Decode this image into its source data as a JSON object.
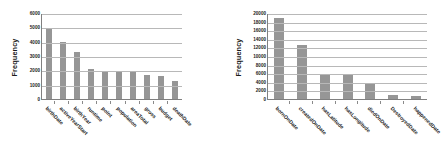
{
  "figure": {
    "background_color": "#ffffff",
    "bar_color": "#969696",
    "gridline_color": "#b8b8b8",
    "axis_color": "#808080"
  },
  "chart_data": [
    {
      "type": "bar",
      "title": "",
      "xlabel": "",
      "ylabel": "Frequency",
      "ylim": [
        0,
        6000
      ],
      "yticks": [
        0,
        1000,
        2000,
        3000,
        4000,
        5000,
        6000
      ],
      "ytick_labels": [
        "0",
        "1000",
        "2000",
        "3000",
        "4000",
        "5000",
        "6000"
      ],
      "grid": true,
      "legend": false,
      "categories": [
        "birthDate",
        "activeYearStart",
        "birthYear",
        "runtime",
        "point",
        "population",
        "areaTotal",
        "gross",
        "budget",
        "deathDate"
      ],
      "values": [
        4850,
        4000,
        3300,
        2100,
        1950,
        1950,
        1930,
        1700,
        1600,
        1250
      ]
    },
    {
      "type": "bar",
      "title": "",
      "xlabel": "",
      "ylabel": "Frequency",
      "ylim": [
        0,
        20000
      ],
      "yticks": [
        0,
        2000,
        4000,
        6000,
        8000,
        10000,
        12000,
        14000,
        16000,
        18000,
        20000
      ],
      "ytick_labels": [
        "0",
        "2000",
        "4000",
        "6000",
        "8000",
        "10000",
        "12000",
        "14000",
        "16000",
        "18000",
        "20000"
      ],
      "grid": true,
      "legend": false,
      "categories": [
        "bornOnDate",
        "createdOnDate",
        "hasLatitude",
        "hasLongitude",
        "diedOnDate",
        "DestroyedDate",
        "happenedDate"
      ],
      "values": [
        18900,
        12500,
        5600,
        5600,
        3800,
        900,
        600
      ]
    }
  ]
}
